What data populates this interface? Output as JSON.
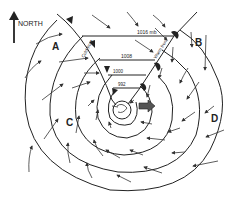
{
  "diagram": {
    "north_label": "NORTH",
    "points": [
      {
        "id": "A",
        "label": "A",
        "x": 56,
        "y": 47
      },
      {
        "id": "B",
        "label": "B",
        "x": 198,
        "y": 44
      },
      {
        "id": "C",
        "label": "C",
        "x": 69,
        "y": 121
      },
      {
        "id": "D",
        "label": "D",
        "x": 215,
        "y": 119
      }
    ],
    "isobars": [
      {
        "label": "1016 mb",
        "x": 137,
        "y": 34
      },
      {
        "label": "1008",
        "x": 120,
        "y": 60
      },
      {
        "label": "1000",
        "x": 110,
        "y": 75
      },
      {
        "label": "992",
        "x": 120,
        "y": 86
      }
    ],
    "fronts": [
      {
        "type": "cold",
        "label": "Cold front"
      },
      {
        "type": "warm",
        "label": "Warm front"
      }
    ],
    "colors": {
      "ink": "#222222",
      "background": "#ffffff"
    }
  }
}
